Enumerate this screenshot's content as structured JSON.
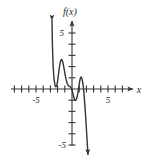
{
  "chart_data": {
    "type": "line",
    "title": "",
    "subtitle": "",
    "xlabel": "x",
    "ylabel": "f(x)",
    "function_label": "f(x)",
    "xlim": [
      -6.8,
      7.2
    ],
    "ylim": [
      -5.9,
      6.2
    ],
    "xtick_step": 1,
    "ytick_step": 1,
    "grid": false,
    "legend": null,
    "axis_labels": {
      "x_axis_name": "x",
      "y_axis_name": "f(x)"
    },
    "tick_labels": {
      "x": [
        {
          "value": -5,
          "text": "-5"
        },
        {
          "value": 5,
          "text": "5"
        }
      ],
      "y": [
        {
          "value": 5,
          "text": "5"
        },
        {
          "value": -5,
          "text": "-5"
        }
      ]
    },
    "x_ticks_unlabeled": [
      -6,
      -4,
      -3,
      -2,
      -1,
      1,
      2,
      3,
      4,
      6
    ],
    "y_ticks_unlabeled": [
      4,
      3,
      2,
      1,
      -1,
      -2,
      -3,
      -4
    ],
    "arrowheads": {
      "x_axis_right": true,
      "y_axis_top": true,
      "curve_start_up": true,
      "curve_end_down": true
    },
    "series": [
      {
        "name": "f(x)",
        "color": "#333333",
        "linewidth": 1.4,
        "points": [
          [
            -2.78,
            6.15
          ],
          [
            -2.74,
            4.6
          ],
          [
            -2.68,
            3.1
          ],
          [
            -2.6,
            1.85
          ],
          [
            -2.5,
            0.95
          ],
          [
            -2.38,
            0.42
          ],
          [
            -2.25,
            0.2
          ],
          [
            -2.12,
            0.3
          ],
          [
            -2.0,
            0.72
          ],
          [
            -1.85,
            1.45
          ],
          [
            -1.7,
            2.15
          ],
          [
            -1.55,
            2.55
          ],
          [
            -1.42,
            2.62
          ],
          [
            -1.3,
            2.45
          ],
          [
            -1.15,
            2.0
          ],
          [
            -1.0,
            1.45
          ],
          [
            -0.85,
            0.95
          ],
          [
            -0.7,
            0.58
          ],
          [
            -0.55,
            0.35
          ],
          [
            -0.4,
            0.25
          ],
          [
            -0.25,
            0.2
          ],
          [
            -0.1,
            0.1
          ],
          [
            0.0,
            -0.08
          ],
          [
            0.12,
            -0.38
          ],
          [
            0.25,
            -0.72
          ],
          [
            0.38,
            -0.95
          ],
          [
            0.5,
            -1.02
          ],
          [
            0.62,
            -0.9
          ],
          [
            0.75,
            -0.58
          ],
          [
            0.88,
            -0.1
          ],
          [
            1.0,
            0.42
          ],
          [
            1.12,
            0.85
          ],
          [
            1.22,
            1.05
          ],
          [
            1.32,
            1.02
          ],
          [
            1.45,
            0.72
          ],
          [
            1.58,
            0.15
          ],
          [
            1.7,
            -0.7
          ],
          [
            1.82,
            -1.75
          ],
          [
            1.95,
            -3.0
          ],
          [
            2.05,
            -4.1
          ],
          [
            2.15,
            -5.1
          ],
          [
            2.22,
            -5.85
          ]
        ]
      }
    ]
  }
}
